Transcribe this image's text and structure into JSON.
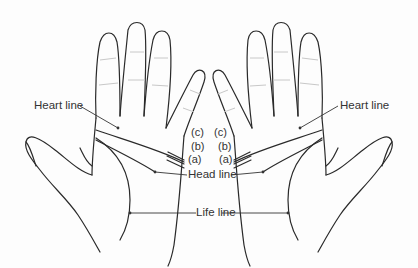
{
  "diagram": {
    "labels": {
      "heart_line_left": "Heart line",
      "heart_line_right": "Heart line",
      "head_line": "Head line",
      "life_line": "Life line",
      "marker_c_left": "(c)",
      "marker_b_left": "(b)",
      "marker_a_left": "(a)",
      "marker_c_right": "(c)",
      "marker_b_right": "(b)",
      "marker_a_right": "(a)"
    },
    "colors": {
      "outline": "#2a2a2a",
      "crease": "#c8c8c8",
      "text": "#333333",
      "background": "#fdfdfd"
    }
  }
}
